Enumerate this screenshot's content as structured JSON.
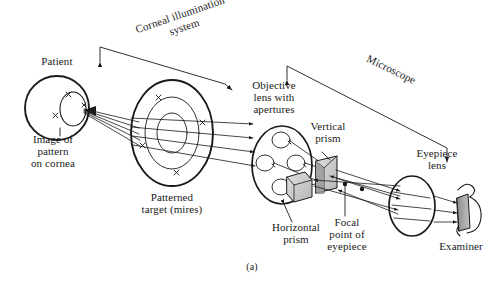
{
  "figure": {
    "caption": "(a)",
    "background_color": "#ffffff",
    "ink_color": "#1a1a1a",
    "prism_fill": "#cfcfcf",
    "examiner_eye_fill": "#a8a8a8"
  },
  "labels": {
    "patient": "Patient",
    "image_of_pattern_on_cornea": "Image of\npattern\non cornea",
    "corneal_illumination_system": "Corneal illumination\nsystem",
    "patterned_target": "Patterned\ntarget (mires)",
    "objective_lens": "Objective\nlens with\napertures",
    "vertical_prism": "Vertical\nprism",
    "horizontal_prism": "Horizontal\nprism",
    "microscope": "Microscope",
    "eyepiece_lens": "Eyepiece\nlens",
    "focal_point_of_eyepiece": "Focal\npoint of\neyepiece",
    "examiner": "Examiner"
  },
  "optical_elements": [
    {
      "name": "patient-eye",
      "type": "sphere",
      "cx": 57,
      "cy": 108,
      "r": 32
    },
    {
      "name": "cornea",
      "type": "arc",
      "cx": 72,
      "cy": 109,
      "rx": 14,
      "ry": 17
    },
    {
      "name": "patterned-target-mires",
      "type": "annular-disc",
      "cx": 172,
      "cy": 133,
      "rx": 41,
      "ry": 53,
      "rings": 3
    },
    {
      "name": "objective-lens-with-apertures",
      "type": "lens-disc",
      "cx": 282,
      "cy": 165,
      "rx": 30,
      "ry": 39,
      "apertures": 4
    },
    {
      "name": "horizontal-prism",
      "type": "prism-block",
      "x": 287,
      "y": 176
    },
    {
      "name": "vertical-prism",
      "type": "prism-block",
      "x": 315,
      "y": 160
    },
    {
      "name": "eyepiece-lens",
      "type": "lens-disc",
      "cx": 412,
      "cy": 206,
      "rx": 23,
      "ry": 30
    },
    {
      "name": "focal-point-markers",
      "type": "points",
      "count": 2
    },
    {
      "name": "examiner-eye",
      "type": "shaded-eye",
      "cx": 463,
      "cy": 213
    }
  ],
  "annotation_arrows": [
    {
      "name": "corneal-illumination-bracket",
      "style": "double-headed",
      "from": [
        100,
        47
      ],
      "to": [
        228,
        86
      ]
    },
    {
      "name": "microscope-bracket",
      "style": "double-headed",
      "from": [
        287,
        66
      ],
      "to": [
        447,
        160
      ]
    },
    {
      "name": "objective-leader",
      "style": "line"
    },
    {
      "name": "vertical-prism-leader",
      "style": "line"
    },
    {
      "name": "horizontal-prism-leader",
      "style": "line"
    },
    {
      "name": "focal-point-leader",
      "style": "line"
    }
  ],
  "ray_bundles": [
    {
      "name": "target-to-cornea-rays",
      "count": 5,
      "direction": "leftward-converging"
    },
    {
      "name": "target-to-objective-rays",
      "count": 4,
      "direction": "rightward-parallel"
    },
    {
      "name": "objective-to-prism-rays",
      "count": 4,
      "direction": "rightward"
    },
    {
      "name": "prism-to-eyepiece-rays",
      "count": 4,
      "direction": "rightward-crossing"
    },
    {
      "name": "eyepiece-to-examiner-rays",
      "count": 3,
      "direction": "rightward"
    }
  ]
}
